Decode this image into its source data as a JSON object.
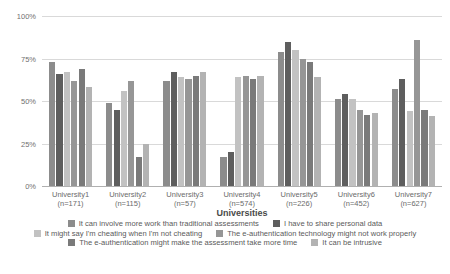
{
  "chart_data": {
    "type": "bar",
    "title": "",
    "xlabel": "Universities",
    "ylabel": "",
    "ylim": [
      0,
      100
    ],
    "yticks": [
      "0%",
      "25%",
      "50%",
      "75%",
      "100%"
    ],
    "ytick_values": [
      0,
      25,
      50,
      75,
      100
    ],
    "grid": true,
    "legend_position": "bottom",
    "categories": [
      "University1",
      "University2",
      "University3",
      "University4",
      "University5",
      "University6",
      "University7"
    ],
    "category_counts": [
      "(n=171)",
      "(n=115)",
      "(n=57)",
      "(n=574)",
      "(n=226)",
      "(n=452)",
      "(n=627)"
    ],
    "series": [
      {
        "name": "It can involve more work than traditional assessments",
        "color": "#8c8c8c",
        "values": [
          73,
          49,
          62,
          17,
          79,
          51,
          57
        ]
      },
      {
        "name": "I have to share personal data",
        "color": "#5e5e5e",
        "values": [
          66,
          45,
          67,
          20,
          85,
          54,
          63
        ]
      },
      {
        "name": "It might say I'm cheating when I'm not cheating",
        "color": "#c2c2c2",
        "values": [
          67,
          56,
          64,
          64,
          80,
          51,
          44
        ]
      },
      {
        "name": "The e-authentication technology might not work properly",
        "color": "#969696",
        "values": [
          62,
          62,
          63,
          65,
          75,
          45,
          86
        ]
      },
      {
        "name": "The e-authentication might make the assessment take more time",
        "color": "#7a7a7a",
        "values": [
          69,
          17,
          65,
          63,
          73,
          42,
          45
        ]
      },
      {
        "name": "It can be intrusive",
        "color": "#b3b3b3",
        "values": [
          58,
          25,
          67,
          65,
          64,
          43,
          41
        ]
      }
    ]
  }
}
